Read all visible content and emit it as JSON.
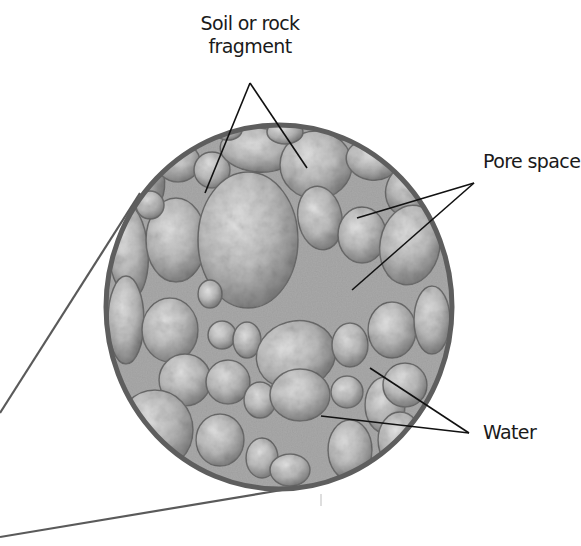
{
  "diagram": {
    "colors": {
      "background": "#ffffff",
      "rim": "#5e5e5e",
      "water_fill": "#a8a8a8",
      "grain_light": "#d8d8d8",
      "grain_mid": "#b9b9b9",
      "grain_dark": "#7d7d7d",
      "leader_line": "#111111",
      "zoom_line": "#5a5a5a",
      "label_text": "#1a1a1a"
    },
    "magnifier": {
      "cx": 279,
      "cy": 307,
      "rx": 174,
      "ry": 183
    },
    "labels": [
      {
        "id": "soil",
        "lines": [
          "Soil or rock",
          "fragment"
        ],
        "x": 250,
        "y": 14,
        "apex": [
          250,
          83
        ],
        "targets": [
          [
            205,
            193
          ],
          [
            307,
            168
          ]
        ]
      },
      {
        "id": "pore",
        "lines": [
          "Pore space"
        ],
        "x": 483,
        "y": 150,
        "apex": [
          474,
          183
        ],
        "targets": [
          [
            357,
            218
          ],
          [
            352,
            290
          ]
        ]
      },
      {
        "id": "water",
        "lines": [
          "Water"
        ],
        "x": 483,
        "y": 420,
        "apex": [
          469,
          433
        ],
        "targets": [
          [
            370,
            368
          ],
          [
            321,
            416
          ]
        ]
      }
    ],
    "zoom_lines": [
      {
        "from": [
          0,
          413
        ],
        "to": [
          140,
          193
        ]
      },
      {
        "from": [
          0,
          537
        ],
        "to": [
          282,
          490
        ]
      }
    ]
  },
  "text": {
    "soil_line1": "Soil or rock",
    "soil_line2": "fragment",
    "pore": "Pore space",
    "water": "Water"
  }
}
